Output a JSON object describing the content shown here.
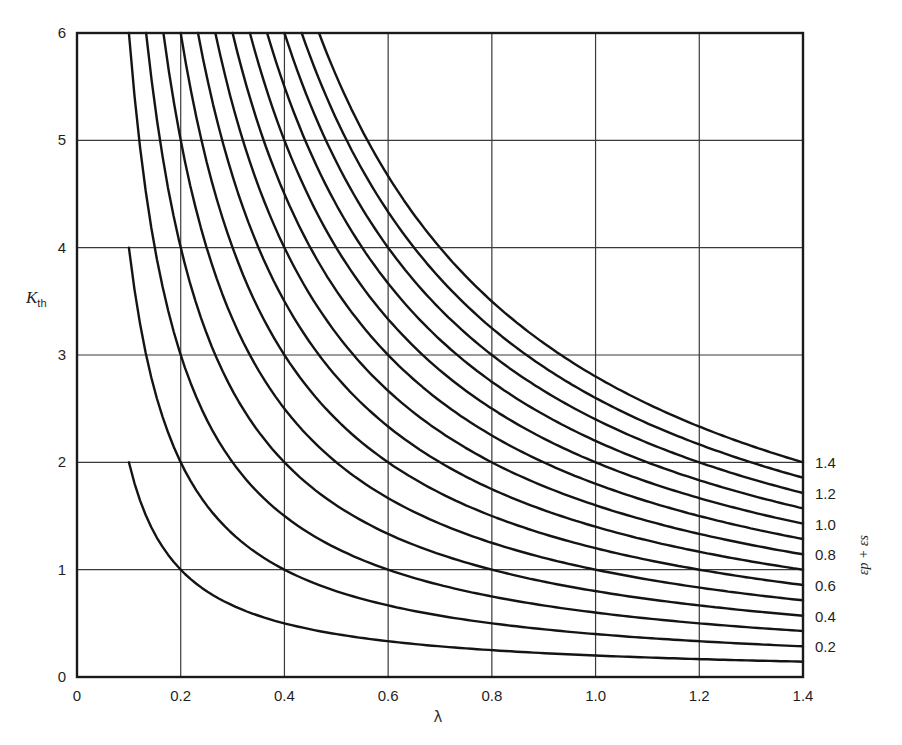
{
  "chart_data": {
    "type": "line",
    "title": "",
    "xlabel": "λ",
    "ylabel": "K_th",
    "ylabel_main": "K",
    "ylabel_sub": "th",
    "right_label": "εp + εs",
    "xlim": [
      0,
      1.4
    ],
    "ylim": [
      0,
      6
    ],
    "grid": true,
    "x_ticks": [
      0,
      0.2,
      0.4,
      0.6,
      0.8,
      1.0,
      1.2,
      1.4
    ],
    "x_tick_labels": [
      "0",
      "0.2",
      "0.4",
      "0.6",
      "0.8",
      "1.0",
      "1.2",
      "1.4"
    ],
    "y_ticks": [
      0,
      1,
      2,
      3,
      4,
      5,
      6
    ],
    "y_tick_labels": [
      "0",
      "1",
      "2",
      "3",
      "4",
      "5",
      "6"
    ],
    "curve_family_formula": "K_th ≈ 2(εp+εs)/λ",
    "curve_labels": [
      "0.2",
      "0.4",
      "0.6",
      "0.8",
      "1.0",
      "1.2",
      "1.4"
    ],
    "series": [
      {
        "name": "0.1",
        "param": 0.1,
        "x": [
          0.1,
          0.2,
          0.4,
          0.6,
          0.8,
          1.0,
          1.2,
          1.4
        ],
        "values": [
          2.0,
          1.0,
          0.5,
          0.33,
          0.25,
          0.2,
          0.17,
          0.14
        ]
      },
      {
        "name": "0.2",
        "param": 0.2,
        "x": [
          0.1,
          0.2,
          0.4,
          0.6,
          0.8,
          1.0,
          1.2,
          1.4
        ],
        "values": [
          4.0,
          2.0,
          1.0,
          0.67,
          0.5,
          0.4,
          0.33,
          0.29
        ]
      },
      {
        "name": "0.3",
        "param": 0.3,
        "x": [
          0.1,
          0.2,
          0.4,
          0.6,
          0.8,
          1.0,
          1.2,
          1.4
        ],
        "values": [
          6.0,
          3.0,
          1.5,
          1.0,
          0.75,
          0.6,
          0.5,
          0.43
        ]
      },
      {
        "name": "0.4",
        "param": 0.4,
        "x": [
          0.133,
          0.2,
          0.4,
          0.6,
          0.8,
          1.0,
          1.2,
          1.4
        ],
        "values": [
          6.0,
          4.0,
          2.0,
          1.33,
          1.0,
          0.8,
          0.67,
          0.57
        ]
      },
      {
        "name": "0.5",
        "param": 0.5,
        "x": [
          0.167,
          0.2,
          0.4,
          0.6,
          0.8,
          1.0,
          1.2,
          1.4
        ],
        "values": [
          6.0,
          5.0,
          2.5,
          1.67,
          1.25,
          1.0,
          0.83,
          0.71
        ]
      },
      {
        "name": "0.6",
        "param": 0.6,
        "x": [
          0.2,
          0.4,
          0.6,
          0.8,
          1.0,
          1.2,
          1.4
        ],
        "values": [
          6.0,
          3.0,
          2.0,
          1.5,
          1.2,
          1.0,
          0.86
        ]
      },
      {
        "name": "0.7",
        "param": 0.7,
        "x": [
          0.233,
          0.4,
          0.6,
          0.8,
          1.0,
          1.2,
          1.4
        ],
        "values": [
          6.0,
          3.5,
          2.33,
          1.75,
          1.4,
          1.17,
          1.0
        ]
      },
      {
        "name": "0.8",
        "param": 0.8,
        "x": [
          0.267,
          0.4,
          0.6,
          0.8,
          1.0,
          1.2,
          1.4
        ],
        "values": [
          6.0,
          4.0,
          2.67,
          2.0,
          1.6,
          1.33,
          1.14
        ]
      },
      {
        "name": "0.9",
        "param": 0.9,
        "x": [
          0.3,
          0.4,
          0.6,
          0.8,
          1.0,
          1.2,
          1.4
        ],
        "values": [
          6.0,
          4.5,
          3.0,
          2.25,
          1.8,
          1.5,
          1.29
        ]
      },
      {
        "name": "1.0",
        "param": 1.0,
        "x": [
          0.333,
          0.4,
          0.6,
          0.8,
          1.0,
          1.2,
          1.4
        ],
        "values": [
          6.0,
          5.0,
          3.33,
          2.5,
          2.0,
          1.67,
          1.43
        ]
      },
      {
        "name": "1.1",
        "param": 1.1,
        "x": [
          0.367,
          0.4,
          0.6,
          0.8,
          1.0,
          1.2,
          1.4
        ],
        "values": [
          6.0,
          5.5,
          3.67,
          2.75,
          2.2,
          1.83,
          1.57
        ]
      },
      {
        "name": "1.2",
        "param": 1.2,
        "x": [
          0.4,
          0.6,
          0.8,
          1.0,
          1.2,
          1.4
        ],
        "values": [
          6.0,
          4.0,
          3.0,
          2.4,
          2.0,
          1.71
        ]
      },
      {
        "name": "1.3",
        "param": 1.3,
        "x": [
          0.433,
          0.6,
          0.8,
          1.0,
          1.2,
          1.4
        ],
        "values": [
          6.0,
          4.33,
          3.25,
          2.6,
          2.17,
          1.86
        ]
      },
      {
        "name": "1.4",
        "param": 1.4,
        "x": [
          0.467,
          0.6,
          0.8,
          1.0,
          1.2,
          1.4
        ],
        "values": [
          6.0,
          4.67,
          3.5,
          2.8,
          2.33,
          2.0
        ]
      }
    ],
    "legend_position": "right, labels beside curve ends"
  }
}
